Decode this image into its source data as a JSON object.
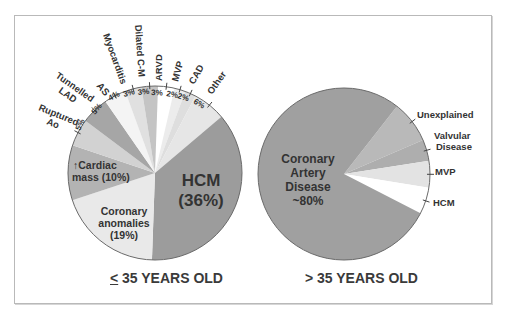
{
  "chart_data": [
    {
      "type": "pie",
      "title": "≤ 35 YEARS OLD",
      "title_prefix": "<",
      "title_rest": " 35 YEARS OLD",
      "center": [
        155,
        173
      ],
      "radius": 87,
      "start_angle": 2,
      "slices": [
        {
          "label": "ARVD",
          "value": 3,
          "pct_label": "3%",
          "color": "#ffffff"
        },
        {
          "label": "MVP",
          "value": 2,
          "pct_label": "2%",
          "color": "#ececec"
        },
        {
          "label": "CAD",
          "value": 2,
          "pct_label": "2%",
          "color": "#dedede"
        },
        {
          "label": "Other",
          "value": 6,
          "pct_label": "6%",
          "color": "#e6e6e6"
        },
        {
          "label": "HCM",
          "value": 36,
          "pct_label": "(36%)",
          "color": "#9c9c9c"
        },
        {
          "label": "Coronary anomalies",
          "value": 19,
          "pct_label": "(19%)",
          "color": "#e9e9e9"
        },
        {
          "label": "↑Cardiac mass",
          "value": 10,
          "pct_label": "(10%)",
          "color": "#b3b3b3"
        },
        {
          "label": "Ruptured Ao",
          "value": 5,
          "pct_label": "5%",
          "color": "#d2d2d2"
        },
        {
          "label": "Tunnelled LAD",
          "value": 5,
          "pct_label": "5%",
          "color": "#a6a6a6"
        },
        {
          "label": "AS",
          "value": 4,
          "pct_label": "4%",
          "color": "#f4f4f4"
        },
        {
          "label": "Myocarditis",
          "value": 3,
          "pct_label": "3%",
          "color": "#e0e0e0"
        },
        {
          "label": "Dilated C-M",
          "value": 3,
          "pct_label": "3%",
          "color": "#c4c4c4"
        }
      ]
    },
    {
      "type": "pie",
      "title": "> 35 YEARS OLD",
      "center": [
        344,
        174
      ],
      "radius": 86,
      "start_angle": 38,
      "slices": [
        {
          "label": "Unexplained",
          "value": 8,
          "color": "#b9b9b9"
        },
        {
          "label": "Valvular Disease",
          "value": 4,
          "color": "#aeaeae"
        },
        {
          "label": "MVP",
          "value": 5,
          "color": "#e3e3e3"
        },
        {
          "label": "HCM",
          "value": 5,
          "color": "#ffffff"
        },
        {
          "label": "Coronary Artery Disease",
          "value": 78,
          "pct_label": "~80%",
          "color": "#a0a0a0"
        }
      ]
    }
  ],
  "labels": {
    "left": {
      "hcm": [
        "HCM",
        "(36%)"
      ],
      "coronary_anomalies": [
        "Coronary",
        "anomalies",
        "(19%)"
      ],
      "cardiac_mass": [
        "↑Cardiac",
        "mass (10%)"
      ],
      "ruptured_ao": [
        "Ruptured",
        "Ao"
      ],
      "tunnelled_lad": [
        "Tunnelled",
        "LAD"
      ],
      "as": "AS",
      "myocarditis": "Myocarditis",
      "dilated_cm": "Dilated C-M",
      "arvd": "ARVD",
      "mvp": "MVP",
      "cad": "CAD",
      "other": "Other",
      "pct": {
        "ruptured": "5%",
        "tunnelled": "5%",
        "as": "4%",
        "myocarditis": "3%",
        "dilated": "3%",
        "arvd": "3%",
        "mvp": "2%",
        "cad": "2%",
        "other": "6%"
      }
    },
    "right": {
      "cad": [
        "Coronary",
        "Artery",
        "Disease",
        "~80%"
      ],
      "unexplained": "Unexplained",
      "valvular": [
        "Valvular",
        "Disease"
      ],
      "mvp": "MVP",
      "hcm": "HCM"
    }
  },
  "titles": {
    "left_prefix": "<",
    "left_rest": " 35 YEARS OLD",
    "right": "> 35 YEARS OLD"
  }
}
